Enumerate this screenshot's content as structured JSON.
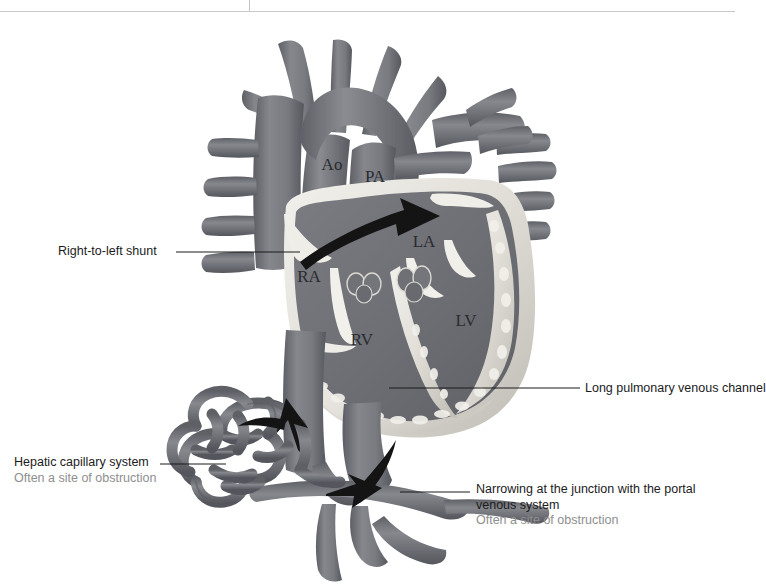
{
  "figure": {
    "type": "anatomical-illustration",
    "palette": {
      "background": "#ffffff",
      "chamber_blood": "#6e7076",
      "vessel_mid": "#73757b",
      "vessel_dark": "#5c5e64",
      "vessel_light": "#8b8d93",
      "myocardium_light": "#e8e6e0",
      "myocardium_shadow": "#b9b6ae",
      "arrow": "#141414",
      "label_text": "#1b1b1b",
      "label_sub_text": "#8e8e8e",
      "rule": "#c9c9c9"
    }
  },
  "rules": {
    "horizontal_present": true,
    "vertical_tick_present": true
  },
  "chamber_labels": [
    {
      "key": "ao",
      "text": "Ao",
      "x": 332,
      "y": 170
    },
    {
      "key": "pa",
      "text": "PA",
      "x": 369,
      "y": 181
    },
    {
      "key": "la",
      "text": "LA",
      "x": 417,
      "y": 245
    },
    {
      "key": "ra",
      "text": "RA",
      "x": 300,
      "y": 281
    },
    {
      "key": "rv",
      "text": "RV",
      "x": 356,
      "y": 344
    },
    {
      "key": "lv",
      "text": "LV",
      "x": 461,
      "y": 325
    }
  ],
  "annotations": {
    "shunt": {
      "title": "Right-to-left shunt",
      "sub": ""
    },
    "hepatic": {
      "title": "Hepatic capillary system",
      "sub": "Often a site of obstruction"
    },
    "long_pv": {
      "title": "Long pulmonary venous channel",
      "sub": ""
    },
    "narrowing": {
      "title": "Narrowing at the junction with the portal venous system",
      "sub": "Often a site of obstruction"
    }
  },
  "leader_lines": [
    {
      "name": "shunt-leader",
      "x1": 176,
      "y1": 252,
      "x2": 300,
      "y2": 252
    },
    {
      "name": "hepatic-leader",
      "x1": 160,
      "y1": 464,
      "x2": 225,
      "y2": 464
    },
    {
      "name": "long-pv-leader",
      "x1": 389,
      "y1": 388,
      "x2": 580,
      "y2": 388
    },
    {
      "name": "narrowing-leader",
      "x1": 400,
      "y1": 492,
      "x2": 470,
      "y2": 492
    }
  ],
  "flow_arrows": [
    {
      "name": "right-to-left-shunt-arrow",
      "direction": "right",
      "from": "RA",
      "to": "LA"
    },
    {
      "name": "ivc-upward-arrow",
      "direction": "up",
      "from": "inferior vena cava",
      "to": "right atrium"
    },
    {
      "name": "portal-inflow-arrow",
      "direction": "left",
      "from": "portal vein",
      "to": "hepatic capillary system"
    }
  ]
}
